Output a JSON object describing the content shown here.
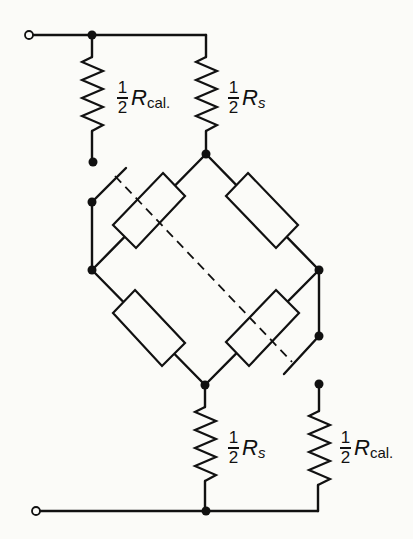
{
  "diagram": {
    "labels": {
      "rcal_top": {
        "numerator": "1",
        "denominator": "2",
        "symbol": "R",
        "subscript": "cal."
      },
      "rs_top": {
        "numerator": "1",
        "denominator": "2",
        "symbol": "R",
        "subscript": "s"
      },
      "rs_bottom": {
        "numerator": "1",
        "denominator": "2",
        "symbol": "R",
        "subscript": "s"
      },
      "rcal_bottom": {
        "numerator": "1",
        "denominator": "2",
        "symbol": "R",
        "subscript": "cal."
      }
    },
    "components": [
      {
        "id": "terminal-top",
        "type": "open-terminal"
      },
      {
        "id": "terminal-bottom",
        "type": "open-terminal"
      },
      {
        "id": "rcal-top",
        "type": "resistor-zigzag",
        "value": "1/2 R_cal."
      },
      {
        "id": "rs-top",
        "type": "resistor-zigzag",
        "value": "1/2 R_s"
      },
      {
        "id": "rs-bottom",
        "type": "resistor-zigzag",
        "value": "1/2 R_s"
      },
      {
        "id": "rcal-bottom",
        "type": "resistor-zigzag",
        "value": "1/2 R_cal."
      },
      {
        "id": "bridge-arm-upper-left",
        "type": "resistor-box"
      },
      {
        "id": "bridge-arm-upper-right",
        "type": "resistor-box"
      },
      {
        "id": "bridge-arm-lower-left",
        "type": "resistor-box"
      },
      {
        "id": "bridge-arm-lower-right",
        "type": "resistor-box"
      },
      {
        "id": "switch-left",
        "type": "switch"
      },
      {
        "id": "switch-right",
        "type": "switch"
      },
      {
        "id": "mechanical-link",
        "type": "dashed-ganged-link"
      }
    ],
    "colors": {
      "ink": "#111111",
      "paper": "#fbfbf8"
    }
  }
}
